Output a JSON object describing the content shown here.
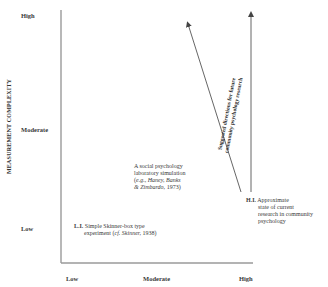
{
  "diagram": {
    "y_axis": {
      "label": "MEASUREMENT COMPLEXITY",
      "ticks": [
        "High",
        "Moderate",
        "Low"
      ]
    },
    "x_axis": {
      "ticks": [
        "Low",
        "Moderate",
        "High"
      ]
    },
    "points": [
      {
        "id": "L.I.",
        "lines": [
          "Simple Skinner-box type",
          "experiment (cf. Skinner, 1938)"
        ],
        "prefix": "L.I.",
        "line1": "Simple Skinner-box type",
        "line2_plain": "experiment (",
        "line2_italic": "cf. Skinner,",
        "line2_end": " 1938)"
      },
      {
        "id": "social-sim",
        "line1": "A social psychology",
        "line2": "laboratory simulation",
        "line3_plain": "(",
        "line3_italic": "e.g., Haney, Banks",
        "line4_italic": "& Zimbardo,",
        "line4_end": " 1973)"
      },
      {
        "id": "H.I.",
        "prefix": "H.I.",
        "line1": "Approximate",
        "line2": "state of current",
        "line3": "research in community",
        "line4": "psychology"
      }
    ],
    "arrow_annotation": {
      "line1": "Suggested directions for future",
      "line2": "community psychology research"
    },
    "colors": {
      "axis": "#9a9a9a",
      "arrow": "#555555",
      "text": "#2a2a2a"
    }
  }
}
